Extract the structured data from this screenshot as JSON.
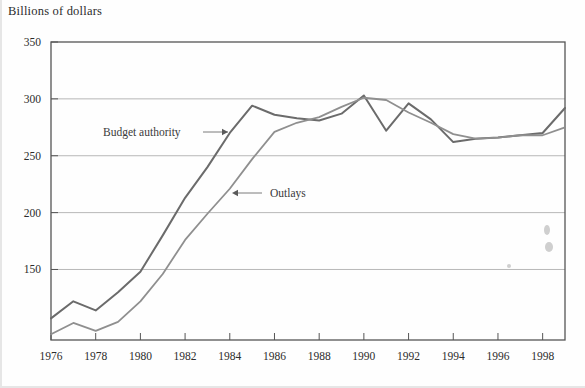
{
  "figure": {
    "axis_title": "Billions of dollars"
  },
  "chart_data": {
    "type": "line",
    "title": "Billions of dollars",
    "xlabel": "",
    "ylabel": "Billions of dollars",
    "xlim": [
      1976,
      1999
    ],
    "ylim": [
      88,
      350
    ],
    "grid": "horizontal",
    "legend_position": "inline-annotations",
    "yticks": [
      150,
      200,
      250,
      300,
      350
    ],
    "ytick_labels": [
      "150",
      "200",
      "250",
      "300",
      "350"
    ],
    "xticks": [
      1976,
      1978,
      1980,
      1982,
      1984,
      1986,
      1988,
      1990,
      1992,
      1994,
      1996,
      1998
    ],
    "xtick_labels": [
      "1976",
      "1978",
      "1980",
      "1982",
      "1984",
      "1986",
      "1988",
      "1990",
      "1992",
      "1994",
      "1996",
      "1998"
    ],
    "x": [
      1976,
      1977,
      1978,
      1979,
      1980,
      1981,
      1982,
      1983,
      1984,
      1985,
      1986,
      1987,
      1988,
      1989,
      1990,
      1991,
      1992,
      1993,
      1994,
      1995,
      1996,
      1997,
      1998,
      1999
    ],
    "series": [
      {
        "name": "Budget authority",
        "color": "#6b6b6b",
        "values": [
          107,
          122,
          114,
          130,
          148,
          180,
          213,
          240,
          270,
          294,
          286,
          283,
          281,
          287,
          303,
          272,
          296,
          282,
          262,
          265,
          266,
          268,
          270,
          292
        ]
      },
      {
        "name": "Outlays",
        "color": "#8f8f8f",
        "values": [
          93,
          103,
          96,
          104,
          122,
          146,
          176,
          199,
          221,
          247,
          271,
          279,
          284,
          293,
          301,
          299,
          288,
          279,
          269,
          265,
          266,
          268,
          268,
          275
        ]
      }
    ],
    "annotations": [
      {
        "text": "Budget authority",
        "target_series": "Budget authority",
        "arrow_direction": "right"
      },
      {
        "text": "Outlays",
        "target_series": "Outlays",
        "arrow_direction": "left"
      }
    ]
  }
}
